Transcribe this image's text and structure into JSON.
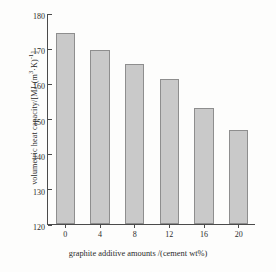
{
  "chart_data": {
    "type": "bar",
    "title": "",
    "categories": [
      "0",
      "4",
      "8",
      "12",
      "16",
      "20"
    ],
    "values": [
      174.2,
      169.5,
      165.5,
      161.2,
      153.0,
      146.7
    ],
    "series": [
      {
        "name": "volumetric heat capacity",
        "values": [
          174.2,
          169.5,
          165.5,
          161.2,
          153.0,
          146.7
        ]
      }
    ],
    "xlabel": "graphite additive amounts /(cement wt%)",
    "ylabel_parts": {
      "text": "volumetric heat capacity/[MJ·(m",
      "sup1": "3",
      "mid": "·K)",
      "sup2": "-1",
      "tail": "]"
    },
    "ylabel": "volumetric heat capacity/[MJ·(m3·K)-1]",
    "yticks": [
      "120",
      "130",
      "140",
      "150",
      "160",
      "170",
      "180"
    ],
    "ytick_values": [
      120,
      130,
      140,
      150,
      160,
      170,
      180
    ],
    "ylim": [
      120,
      180
    ],
    "xlim_categories": 6,
    "grid": false,
    "legend": false,
    "bar_fill_color": "#c9c9c9",
    "bar_edge_color": "#8e8e8e",
    "axis_color": "#4a4a4a",
    "background_color": "#fdfdfc"
  }
}
